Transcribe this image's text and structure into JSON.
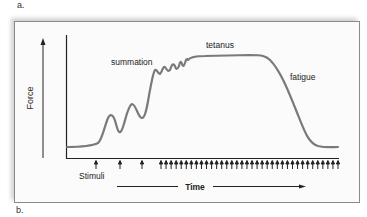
{
  "panel_labels": {
    "top": "a.",
    "bottom": "b."
  },
  "diagram": {
    "y_axis_label": "Force",
    "x_axis_label": "Time",
    "stimuli_label": "Stimuli",
    "annotations": {
      "summation": "summation",
      "tetanus": "tetanus",
      "fatigue": "fatigue"
    },
    "colors": {
      "curve": "#7a7a7a",
      "axes": "#222222",
      "frame": "#8a8a8a"
    },
    "stimuli": {
      "single_arrow_x": [
        96,
        120,
        142
      ],
      "tetanus_arrow_start_x": 161,
      "tetanus_arrow_end_x": 338,
      "tetanus_arrow_count": 36
    }
  }
}
